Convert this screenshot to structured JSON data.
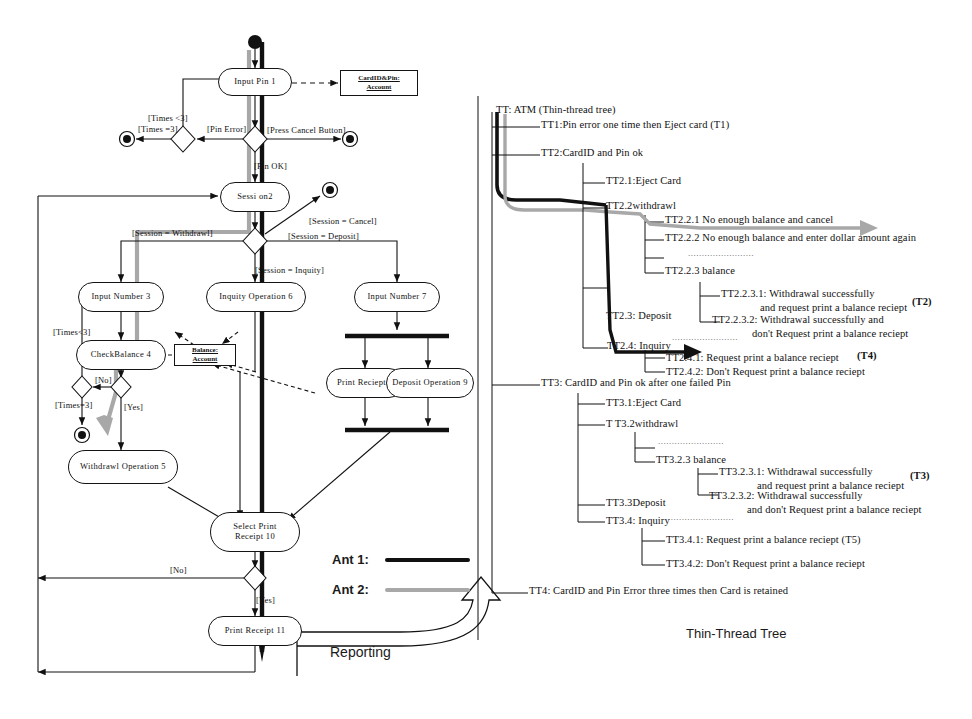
{
  "figure": {
    "left_title": "",
    "right_title": "TT: ATM (Thin-thread tree)",
    "tree_caption": "Thin-Thread Tree",
    "reporting_label": "Reporting"
  },
  "legend": {
    "items": [
      {
        "label": "Ant 1:",
        "color": "#111111"
      },
      {
        "label": "Ant 2:",
        "color": "#a8a8a8"
      }
    ]
  },
  "activity": {
    "nodes": [
      {
        "id": "input-pin",
        "label": "Input  Pin 1"
      },
      {
        "id": "session",
        "label": "Sessi on2"
      },
      {
        "id": "input-number-3",
        "label": "Input Number 3"
      },
      {
        "id": "check-balance",
        "label": "CheckBalance 4"
      },
      {
        "id": "withdrawl-op",
        "label": "Withdrawl Operation 5"
      },
      {
        "id": "inquity-op",
        "label": "Inquity Operation 6"
      },
      {
        "id": "input-number-7",
        "label": "Input  Number 7"
      },
      {
        "id": "print-reciept-8",
        "label": "Print Reciept 8"
      },
      {
        "id": "deposit-op-9",
        "label": "Deposit Operation 9"
      },
      {
        "id": "select-print",
        "label": "Select Print\nReceipt 10"
      },
      {
        "id": "print-receipt-11",
        "label": "Print Receipt 11"
      }
    ],
    "objects": [
      {
        "id": "cardid-pin-account",
        "label": "CardID&Pin:\nAccount"
      },
      {
        "id": "balance-account",
        "label": "Balance:\nAccount"
      }
    ],
    "guards": [
      {
        "id": "g-times-lt3-top",
        "text": "[Times <3]"
      },
      {
        "id": "g-times-eq3-top",
        "text": "[Times =3]"
      },
      {
        "id": "g-pin-error",
        "text": "[Pin Error]"
      },
      {
        "id": "g-press-cancel",
        "text": "[Press Cancel Button]"
      },
      {
        "id": "g-pin-ok",
        "text": "[Pin OK]"
      },
      {
        "id": "g-session-withdrawl",
        "text": "[Session = Withdrawl]"
      },
      {
        "id": "g-session-cancel",
        "text": "[Session = Cancel]"
      },
      {
        "id": "g-session-deposit",
        "text": "[Session = Deposit]"
      },
      {
        "id": "g-session-inquity",
        "text": "[Session = Inquity]"
      },
      {
        "id": "g-times-lt3-bal",
        "text": "[Times<3]"
      },
      {
        "id": "g-no-bal",
        "text": "[No]"
      },
      {
        "id": "g-times-eq3-bal",
        "text": "[Times=3]"
      },
      {
        "id": "g-yes-bal",
        "text": "[Yes]"
      },
      {
        "id": "g-no-print",
        "text": "[No]"
      },
      {
        "id": "g-yes-print",
        "text": "[Yes]"
      }
    ]
  },
  "tree": {
    "root": "TT: ATM (Thin-thread tree)",
    "items": [
      {
        "id": "tt1",
        "text": "TT1:Pin error one time then Eject card (T1)",
        "indent": 1
      },
      {
        "id": "tt2",
        "text": "TT2:CardID and Pin ok",
        "indent": 1
      },
      {
        "id": "tt2-1",
        "text": "TT2.1:Eject Card",
        "indent": 2
      },
      {
        "id": "tt2-2",
        "text": "TT2.2withdrawl",
        "indent": 2
      },
      {
        "id": "tt2-2-1",
        "text": "TT2.2.1 No enough balance and cancel",
        "indent": 3
      },
      {
        "id": "tt2-2-2",
        "text": "TT2.2.2 No enough balance and enter dollar amount again",
        "indent": 3
      },
      {
        "id": "tt2-2-dots",
        "text": "........................",
        "indent": 3
      },
      {
        "id": "tt2-2-3",
        "text": "TT2.2.3 balance",
        "indent": 3
      },
      {
        "id": "tt2-2-3-1",
        "text": "TT2.2.3.1: Withdrawal successfully",
        "indent": 4
      },
      {
        "id": "tt2-2-3-1b",
        "text": "and request print a balance reciept",
        "indent": 5
      },
      {
        "id": "tt2-2-3-2",
        "text": "TT2.2.3.2: Withdrawal successfully and",
        "indent": 4
      },
      {
        "id": "tt2-2-3-2b",
        "text": "don't Request print a balance reciept",
        "indent": 5
      },
      {
        "id": "tt2-3",
        "text": "TT2.3: Deposit",
        "indent": 2
      },
      {
        "id": "tt2-3-dots",
        "text": "........................",
        "indent": 3
      },
      {
        "id": "tt2-4",
        "text": "TT2.4: Inquiry",
        "indent": 2
      },
      {
        "id": "tt2-4-1",
        "text": "TT2.4.1: Request print a balance reciept",
        "indent": 3
      },
      {
        "id": "tt2-4-2",
        "text": "TT2.4.2: Don't Request print a balance reciept",
        "indent": 3
      },
      {
        "id": "tt3",
        "text": "TT3: CardID and Pin ok after one failed Pin",
        "indent": 1
      },
      {
        "id": "tt3-1",
        "text": "TT3.1:Eject Card",
        "indent": 2
      },
      {
        "id": "tt3-2",
        "text": "T  T3.2withdrawl",
        "indent": 2
      },
      {
        "id": "tt3-2-dots",
        "text": "........................",
        "indent": 3
      },
      {
        "id": "tt3-2-3",
        "text": "TT3.2.3 balance",
        "indent": 3
      },
      {
        "id": "tt3-2-3-1",
        "text": "TT3.2.3.1: Withdrawal successfully",
        "indent": 4
      },
      {
        "id": "tt3-2-3-1b",
        "text": "and request print a balance reciept",
        "indent": 5
      },
      {
        "id": "tt3-2-3-2",
        "text": "TT3.2.3.2: Withdrawal successfully",
        "indent": 4
      },
      {
        "id": "tt3-2-3-2b",
        "text": "and don't Request print a balance reciept",
        "indent": 5
      },
      {
        "id": "tt3-3",
        "text": "TT3.3Deposit",
        "indent": 2
      },
      {
        "id": "tt3-3-dots",
        "text": "........................",
        "indent": 3
      },
      {
        "id": "tt3-4",
        "text": "TT3.4: Inquiry",
        "indent": 2
      },
      {
        "id": "tt3-4-1",
        "text": "TT3.4.1: Request print a balance reciept (T5)",
        "indent": 3
      },
      {
        "id": "tt3-4-2",
        "text": "TT3.4.2: Don't Request print a balance reciept",
        "indent": 3
      },
      {
        "id": "tt4",
        "text": "TT4: CardID and Pin Error three times then Card is retained",
        "indent": 1
      }
    ],
    "tags": [
      {
        "id": "tag-t2",
        "text": "(T2)"
      },
      {
        "id": "tag-t4",
        "text": "(T4)"
      },
      {
        "id": "tag-t3",
        "text": "(T3)"
      }
    ]
  },
  "colors": {
    "ink": "#111111",
    "ant1": "#111111",
    "ant2": "#a8a8a8",
    "paper": "#ffffff"
  }
}
